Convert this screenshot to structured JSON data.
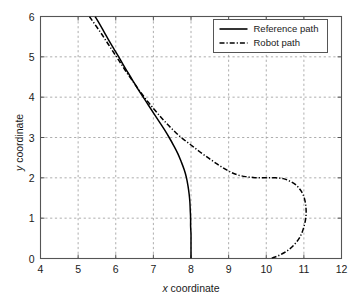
{
  "figure": {
    "background": "#ffffff",
    "axes_color": "#555555",
    "grid_color": "#999999",
    "line_color": "#000000"
  },
  "axis": {
    "x": {
      "label_var": "x",
      "label_text": " coordinate",
      "ticks": [
        "4",
        "5",
        "6",
        "7",
        "8",
        "9",
        "10",
        "11",
        "12"
      ],
      "min": 4,
      "max": 12
    },
    "y": {
      "label_var": "y",
      "label_text": " coordinate",
      "ticks": [
        "0",
        "1",
        "2",
        "3",
        "4",
        "5",
        "6"
      ],
      "min": 0,
      "max": 6
    }
  },
  "legend": {
    "position": "top-right",
    "entries": [
      {
        "label": "Reference path",
        "style": "solid"
      },
      {
        "label": "Robot path",
        "style": "dashdot"
      }
    ]
  },
  "chart_data": {
    "type": "line",
    "title": "",
    "xlabel": "x coordinate",
    "ylabel": "y coordinate",
    "xlim": [
      4,
      12
    ],
    "ylim": [
      0,
      6
    ],
    "grid": true,
    "legend_position": "top-right",
    "series": [
      {
        "name": "Reference path",
        "style": "solid",
        "points": [
          [
            5.45,
            6.0
          ],
          [
            5.58,
            5.8
          ],
          [
            5.7,
            5.6
          ],
          [
            5.82,
            5.4
          ],
          [
            5.95,
            5.2
          ],
          [
            6.08,
            5.0
          ],
          [
            6.2,
            4.8
          ],
          [
            6.33,
            4.6
          ],
          [
            6.46,
            4.4
          ],
          [
            6.59,
            4.2
          ],
          [
            6.73,
            4.0
          ],
          [
            6.87,
            3.8
          ],
          [
            7.01,
            3.6
          ],
          [
            7.15,
            3.4
          ],
          [
            7.29,
            3.2
          ],
          [
            7.42,
            3.0
          ],
          [
            7.54,
            2.8
          ],
          [
            7.65,
            2.6
          ],
          [
            7.74,
            2.4
          ],
          [
            7.82,
            2.2
          ],
          [
            7.88,
            2.0
          ],
          [
            7.92,
            1.8
          ],
          [
            7.95,
            1.6
          ],
          [
            7.97,
            1.4
          ],
          [
            7.98,
            1.2
          ],
          [
            7.99,
            1.0
          ],
          [
            7.99,
            0.8
          ],
          [
            8.0,
            0.6
          ],
          [
            8.0,
            0.4
          ],
          [
            8.0,
            0.2
          ],
          [
            8.0,
            0.0
          ]
        ]
      },
      {
        "name": "Robot path",
        "style": "dashdot",
        "points": [
          [
            5.3,
            6.0
          ],
          [
            5.45,
            5.8
          ],
          [
            5.6,
            5.6
          ],
          [
            5.74,
            5.4
          ],
          [
            5.88,
            5.2
          ],
          [
            6.02,
            5.0
          ],
          [
            6.16,
            4.8
          ],
          [
            6.3,
            4.6
          ],
          [
            6.45,
            4.4
          ],
          [
            6.6,
            4.2
          ],
          [
            6.76,
            4.0
          ],
          [
            6.93,
            3.8
          ],
          [
            7.11,
            3.6
          ],
          [
            7.3,
            3.4
          ],
          [
            7.51,
            3.2
          ],
          [
            7.74,
            3.0
          ],
          [
            7.99,
            2.82
          ],
          [
            8.24,
            2.64
          ],
          [
            8.48,
            2.48
          ],
          [
            8.7,
            2.34
          ],
          [
            8.9,
            2.22
          ],
          [
            9.08,
            2.13
          ],
          [
            9.25,
            2.07
          ],
          [
            9.45,
            2.03
          ],
          [
            9.65,
            2.01
          ],
          [
            9.85,
            2.0
          ],
          [
            10.05,
            2.0
          ],
          [
            10.25,
            2.0
          ],
          [
            10.45,
            1.98
          ],
          [
            10.62,
            1.92
          ],
          [
            10.78,
            1.83
          ],
          [
            10.9,
            1.71
          ],
          [
            10.99,
            1.56
          ],
          [
            11.04,
            1.38
          ],
          [
            11.06,
            1.18
          ],
          [
            11.05,
            1.0
          ],
          [
            11.01,
            0.82
          ],
          [
            10.95,
            0.64
          ],
          [
            10.86,
            0.48
          ],
          [
            10.74,
            0.34
          ],
          [
            10.6,
            0.22
          ],
          [
            10.45,
            0.13
          ],
          [
            10.3,
            0.06
          ],
          [
            10.18,
            0.02
          ],
          [
            10.1,
            0.0
          ]
        ]
      }
    ]
  }
}
